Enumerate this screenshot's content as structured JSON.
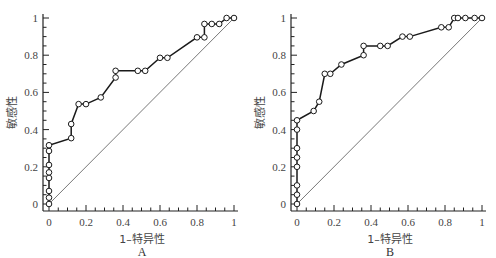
{
  "chart_data": [
    {
      "type": "line",
      "panel_label": "A",
      "title": "",
      "xlabel": "1–特异性",
      "ylabel": "敏感性",
      "xlim": [
        0,
        1
      ],
      "ylim": [
        0,
        1
      ],
      "xticks": [
        "0",
        "0.2",
        "0.4",
        "0.6",
        "0.8",
        "1"
      ],
      "yticks": [
        "0",
        "0.2",
        "0.4",
        "0.6",
        "0.8",
        "1"
      ],
      "grid": false,
      "legend": null,
      "series": [
        {
          "name": "ROC",
          "marker": "open-circle",
          "x": [
            0,
            0,
            0,
            0,
            0,
            0,
            0,
            0,
            0.12,
            0.12,
            0.16,
            0.2,
            0.28,
            0.36,
            0.36,
            0.48,
            0.52,
            0.6,
            0.64,
            0.8,
            0.84,
            0.84,
            0.88,
            0.92,
            0.96,
            1
          ],
          "y": [
            0,
            0.034,
            0.07,
            0.14,
            0.17,
            0.21,
            0.285,
            0.316,
            0.354,
            0.43,
            0.537,
            0.537,
            0.573,
            0.68,
            0.716,
            0.716,
            0.716,
            0.786,
            0.786,
            0.896,
            0.896,
            0.968,
            0.968,
            0.968,
            1,
            1
          ]
        },
        {
          "name": "reference",
          "marker": "none",
          "x": [
            0,
            1
          ],
          "y": [
            0,
            1
          ]
        }
      ]
    },
    {
      "type": "line",
      "panel_label": "B",
      "title": "",
      "xlabel": "1–特异性",
      "ylabel": "敏感性",
      "xlim": [
        0,
        1
      ],
      "ylim": [
        0,
        1
      ],
      "xticks": [
        "0",
        "0.2",
        "0.4",
        "0.6",
        "0.8",
        "1"
      ],
      "yticks": [
        "0",
        "0.2",
        "0.4",
        "0.6",
        "0.8",
        "1"
      ],
      "grid": false,
      "legend": null,
      "series": [
        {
          "name": "ROC",
          "marker": "open-circle",
          "x": [
            0,
            0,
            0,
            0,
            0,
            0,
            0,
            0,
            0.09,
            0.12,
            0.15,
            0.18,
            0.24,
            0.36,
            0.36,
            0.45,
            0.49,
            0.57,
            0.61,
            0.78,
            0.82,
            0.85,
            0.87,
            0.91,
            0.96,
            1
          ],
          "y": [
            0,
            0.05,
            0.1,
            0.2,
            0.25,
            0.3,
            0.4,
            0.45,
            0.5,
            0.55,
            0.7,
            0.7,
            0.75,
            0.8,
            0.85,
            0.85,
            0.85,
            0.9,
            0.9,
            0.95,
            0.95,
            1,
            1,
            1,
            1,
            1
          ]
        },
        {
          "name": "reference",
          "marker": "none",
          "x": [
            0,
            1
          ],
          "y": [
            0,
            1
          ]
        }
      ]
    }
  ],
  "panels": [
    {
      "label": "A",
      "xlabel": "1–特异性",
      "ylabel": "敏感性"
    },
    {
      "label": "B",
      "xlabel": "1–特异性",
      "ylabel": "敏感性"
    }
  ],
  "colors": {
    "line": "#1a1a1a",
    "reference": "#555555",
    "marker_fill": "#ffffff",
    "axis": "#222222"
  }
}
